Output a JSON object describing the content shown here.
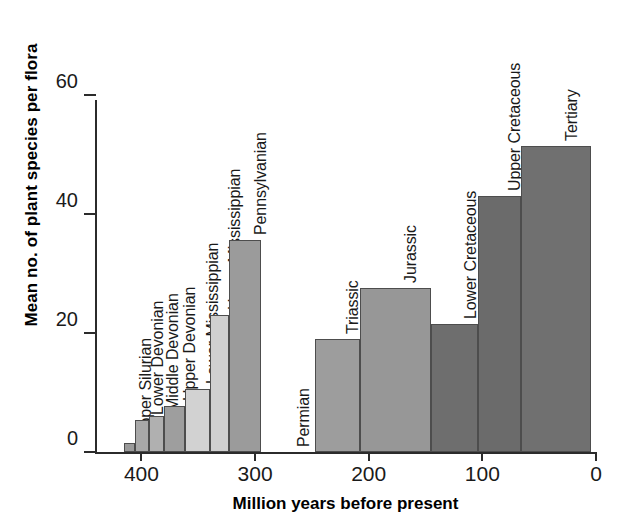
{
  "chart_data": {
    "type": "bar",
    "title": "",
    "xlabel": "Million years before present",
    "ylabel": "Mean no. of plant species per flora",
    "xlim": [
      440,
      0
    ],
    "ylim": [
      0,
      60
    ],
    "x_ticks": [
      400,
      300,
      200,
      100,
      0
    ],
    "x_tick_labels": [
      "400",
      "300",
      "200",
      "100",
      "0"
    ],
    "y_ticks": [
      0,
      20,
      40,
      60
    ],
    "y_tick_labels": [
      "0",
      "20",
      "40",
      "60"
    ],
    "grid": false,
    "legend": "none",
    "bars": [
      {
        "label": "Upper Silurian",
        "value": 1.5,
        "x_start": 415,
        "x_end": 406,
        "color": "#9a9a9a"
      },
      {
        "label": "Lower Devonian",
        "value": 5.3,
        "x_start": 406,
        "x_end": 393,
        "color": "#a8a8a8"
      },
      {
        "label": "Middle Devonian",
        "value": 6.0,
        "x_start": 393,
        "x_end": 380,
        "color": "#b0b0b0"
      },
      {
        "label": "Upper Devonian",
        "value": 7.7,
        "x_start": 380,
        "x_end": 362,
        "color": "#9e9e9e"
      },
      {
        "label": "Lower Mississippian",
        "value": 10.6,
        "x_start": 362,
        "x_end": 340,
        "color": "#d2d2d2"
      },
      {
        "label": "Upper Mississippian",
        "value": 23.0,
        "x_start": 340,
        "x_end": 323,
        "color": "#cfcfcf"
      },
      {
        "label": "Pennsylvanian",
        "value": 35.7,
        "x_start": 323,
        "x_end": 295,
        "color": "#9b9b9b"
      },
      {
        "label": "Permian",
        "value": 0,
        "x_start": 295,
        "x_end": 247,
        "color": "#ffffff"
      },
      {
        "label": "Triassic",
        "value": 19.0,
        "x_start": 247,
        "x_end": 208,
        "color": "#9d9d9d"
      },
      {
        "label": "Jurassic",
        "value": 27.6,
        "x_start": 208,
        "x_end": 145,
        "color": "#979797"
      },
      {
        "label": "Lower Cretaceous",
        "value": 21.5,
        "x_start": 145,
        "x_end": 104,
        "color": "#6e6e6e"
      },
      {
        "label": "Upper Cretaceous",
        "value": 43.0,
        "x_start": 104,
        "x_end": 66,
        "color": "#6b6b6b"
      },
      {
        "label": "Tertiary",
        "value": 51.5,
        "x_start": 66,
        "x_end": 4,
        "color": "#707070"
      }
    ]
  }
}
